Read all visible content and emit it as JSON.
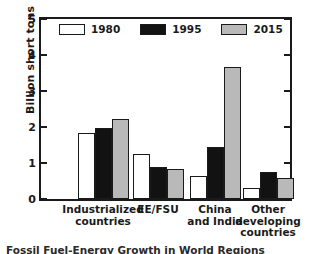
{
  "chart_data": {
    "type": "bar",
    "title": "",
    "xlabel": "",
    "ylabel": "Billion short tons",
    "ylim": [
      0,
      5
    ],
    "yticks": [
      0,
      1,
      2,
      3,
      4,
      5
    ],
    "ytick_labels": [
      "0",
      "1",
      "2",
      "3",
      "4",
      "5"
    ],
    "grid": false,
    "legend_position": "top-inside",
    "categories": [
      "Industrialized\ncountries",
      "EE/FSU",
      "China\nand India",
      "Other\ndeveloping\ncountries"
    ],
    "series": [
      {
        "name": "1980",
        "color": "#ffffff",
        "values": [
          1.82,
          1.25,
          0.63,
          0.31
        ]
      },
      {
        "name": "1995",
        "color": "#121212",
        "values": [
          1.96,
          0.9,
          1.45,
          0.74
        ]
      },
      {
        "name": "2015",
        "color": "#b9b9b9",
        "values": [
          2.23,
          0.82,
          3.66,
          0.57
        ]
      }
    ]
  },
  "legend": {
    "entries": [
      {
        "label": "1980"
      },
      {
        "label": "1995"
      },
      {
        "label": "2015"
      }
    ]
  },
  "caption": {
    "text": "Fossil Fuel-Energy Growth in World Regions"
  }
}
